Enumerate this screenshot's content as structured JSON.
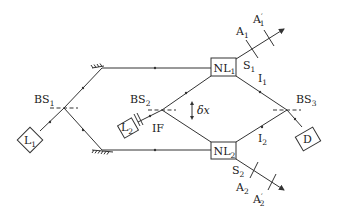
{
  "diagram": {
    "type": "optical-setup-schematic",
    "components": {
      "laser1": {
        "label": "L",
        "sub": "1"
      },
      "laser2": {
        "label": "L",
        "sub": "2"
      },
      "bs1": {
        "label": "BS",
        "sub": "1"
      },
      "bs2": {
        "label": "BS",
        "sub": "2"
      },
      "bs3": {
        "label": "BS",
        "sub": "3"
      },
      "nl1": {
        "label": "NL",
        "sub": "1"
      },
      "nl2": {
        "label": "NL",
        "sub": "2"
      },
      "detector": {
        "label": "D"
      },
      "filter": {
        "label": "IF"
      },
      "displacement": {
        "label": "δx"
      }
    },
    "beams": {
      "s1": {
        "label": "S",
        "sub": "1"
      },
      "s2": {
        "label": "S",
        "sub": "2"
      },
      "i1": {
        "label": "I",
        "sub": "1"
      },
      "i2": {
        "label": "I",
        "sub": "2"
      }
    },
    "apertures": {
      "a1": {
        "label": "A",
        "sub": "1"
      },
      "a1p": {
        "label": "A",
        "prime": "′",
        "sub": "1"
      },
      "a2": {
        "label": "A",
        "sub": "2"
      },
      "a2p": {
        "label": "A",
        "prime": "′",
        "sub": "2"
      }
    }
  }
}
